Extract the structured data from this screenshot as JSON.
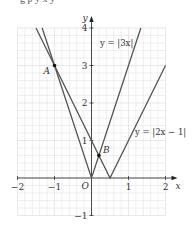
{
  "caption_fragment": "g   p        y         x           y",
  "chart_data": {
    "type": "line",
    "title": "",
    "xlabel": "x",
    "ylabel": "y",
    "xlim": [
      -2,
      2
    ],
    "ylim": [
      -1,
      4
    ],
    "grid": true,
    "grid_minor_step": 0.2,
    "x_ticks": [
      -2,
      -1,
      1,
      2
    ],
    "x_tick_labels": [
      "−2",
      "−1",
      "1",
      "2"
    ],
    "y_ticks": [
      -1,
      1,
      2,
      3,
      4
    ],
    "y_tick_labels": [
      "−1",
      "1",
      "2",
      "3",
      "4"
    ],
    "origin_label": "O",
    "series": [
      {
        "name": "y = |3x|",
        "label": "y = |3x|",
        "points": [
          [
            -1.333,
            4
          ],
          [
            0,
            0
          ],
          [
            1.333,
            4
          ]
        ]
      },
      {
        "name": "y = |2x − 1|",
        "label": "y = |2x − 1|",
        "points": [
          [
            -1.5,
            4
          ],
          [
            0.5,
            0
          ],
          [
            2,
            3
          ]
        ]
      }
    ],
    "annotations": [
      {
        "label": "A",
        "x": -1,
        "y": 3
      },
      {
        "label": "B",
        "x": 0.2,
        "y": 0.6
      }
    ],
    "colors": {
      "lines": "#555555",
      "grid": "#e4e4e4",
      "axis": "#222222",
      "point": "#111111"
    }
  }
}
